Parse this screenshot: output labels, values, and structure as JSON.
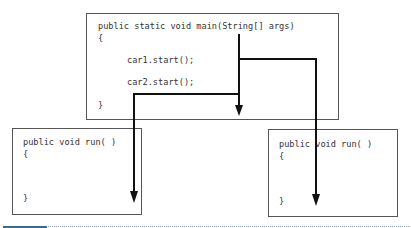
{
  "main_box": {
    "lines": [
      "public static void main(String[] args)",
      "{",
      "car1.start();",
      "car2.start();",
      "}"
    ]
  },
  "left_run_box": {
    "lines": [
      "public void run( )",
      "{",
      "}"
    ]
  },
  "right_run_box": {
    "lines": [
      "public void run( )",
      "{",
      "}"
    ]
  },
  "colors": {
    "border": "#555555",
    "arrow": "#111111",
    "text": "#333333",
    "accent_bar": "#2f6f9f"
  }
}
